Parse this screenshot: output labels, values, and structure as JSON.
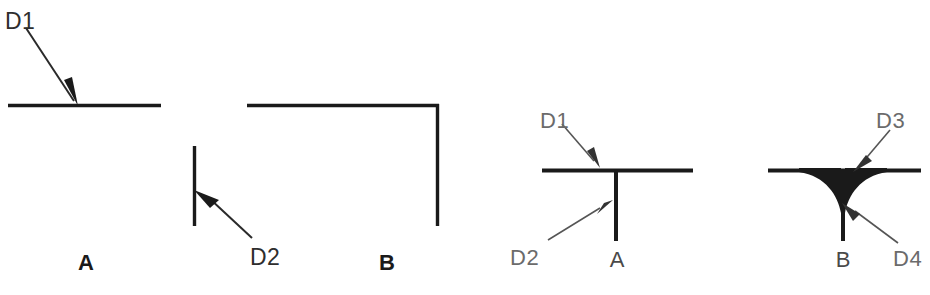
{
  "sheet": {
    "title": "Weld / line junction detail figures",
    "background_color": "#ffffff",
    "ink_color": "#1a1a1a",
    "light_ink_color": "#6b6b6b",
    "width": 930,
    "height": 295
  },
  "figures": [
    {
      "id": "figure-a-left",
      "caption": "A",
      "description": "Single straight horizontal line with leader callout D1 pointing to the line surface",
      "callouts": [
        {
          "label": "D1",
          "points_to": "horizontal-line-surface"
        }
      ]
    },
    {
      "id": "figure-b-left",
      "caption": "B",
      "description": "L-shaped corner: horizontal line turning down into a vertical line, plus a separate short vertical line with leader callout D2",
      "callouts": [
        {
          "label": "D2",
          "points_to": "short-vertical-line-edge"
        }
      ]
    },
    {
      "id": "figure-a-right",
      "caption": "A",
      "description": "Sharp T-junction: vertical stem meeting horizontal line with square corners",
      "callouts": [
        {
          "label": "D1",
          "points_to": "horizontal-line-at-junction"
        },
        {
          "label": "D2",
          "points_to": "vertical-stem"
        }
      ]
    },
    {
      "id": "figure-b-right",
      "caption": "B",
      "description": "Filleted T-junction: vertical stem blended into horizontal line with concave fillet curves",
      "callouts": [
        {
          "label": "D3",
          "points_to": "fillet-at-horizontal-line"
        },
        {
          "label": "D4",
          "points_to": "fillet-root-at-stem"
        }
      ]
    }
  ],
  "labels": {
    "d1_left": "D1",
    "d2_left": "D2",
    "caption_a_left": "A",
    "caption_b_left": "B",
    "d1_right": "D1",
    "d2_right": "D2",
    "caption_a_right": "A",
    "d3_right": "D3",
    "d4_right": "D4",
    "caption_b_right": "B"
  }
}
